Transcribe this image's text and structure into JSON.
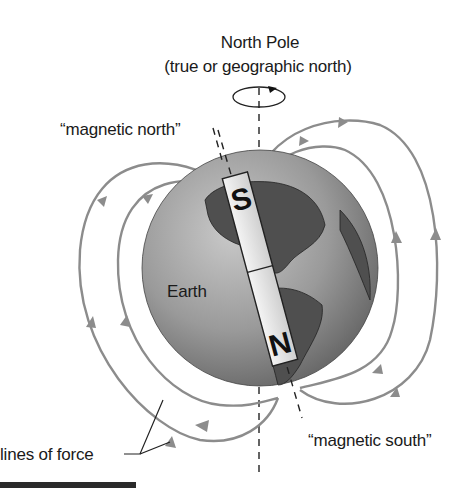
{
  "diagram": {
    "labels": {
      "north_pole_line1": "North Pole",
      "north_pole_line2": "(true or geographic north)",
      "magnetic_north": "“magnetic north”",
      "magnetic_south": "“magnetic south”",
      "earth": "Earth",
      "lines_of_force": "lines of force"
    },
    "magnet": {
      "top_pole": "S",
      "bottom_pole": "N"
    },
    "icons": {
      "rotation": "rotation-arrow-icon"
    },
    "colors": {
      "field_lines": "#8c8c8c",
      "globe_light": "#b8b8b8",
      "globe_dark": "#5e5e5e",
      "magnet_fill": "#e6e6e6",
      "text": "#1a1a1a"
    }
  }
}
